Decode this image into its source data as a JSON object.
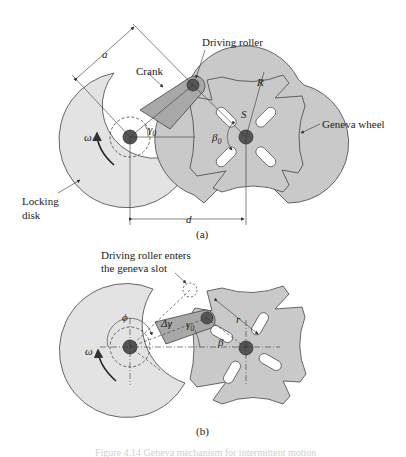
{
  "figure_a": {
    "caption": "(a)",
    "labels": {
      "driving_roller": "Driving roller",
      "crank": "Crank",
      "geneva_wheel": "Geneva wheel",
      "locking_disk_line1": "Locking",
      "locking_disk_line2": "disk"
    },
    "symbols": {
      "a": "a",
      "R": "R",
      "S": "S",
      "beta0": "β",
      "beta0_sub": "0",
      "gamma0": "γ",
      "gamma0_sub": "0",
      "omega": "ω",
      "d": "d"
    }
  },
  "figure_b": {
    "caption": "(b)",
    "labels": {
      "roller_enters_line1": "Driving roller enters",
      "roller_enters_line2": "the geneva slot"
    },
    "symbols": {
      "phi": "ϕ",
      "delta_gamma": "Δγ",
      "gamma0": "γ",
      "gamma0_sub": "0",
      "r": "r",
      "beta": "β",
      "omega": "ω"
    }
  },
  "figure_caption_faint": "Figure 4.14  Geneva mechanism for intermittent motion",
  "colors": {
    "locking_disk": "#e2e2e2",
    "geneva_wheel": "#c8c8c8",
    "crank": "#a9a9a9",
    "pivot": "#555555",
    "line": "#333333"
  }
}
